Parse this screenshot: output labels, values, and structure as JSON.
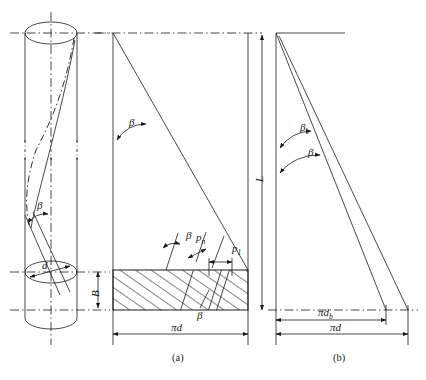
{
  "figure": {
    "background_color": "#ffffff",
    "line_color": "#1a1a1a",
    "captions": [
      {
        "key": "a",
        "text": "(a)"
      },
      {
        "key": "b",
        "text": "(b)"
      }
    ]
  },
  "cylinder_view": {
    "name": "cylinder-with-helix",
    "labels": {
      "beta": "β",
      "diameter": "d"
    }
  },
  "diagram_a": {
    "name": "unrolled-development-a",
    "labels": {
      "beta_top": "β",
      "beta_strip": "β",
      "beta_bottom": "β",
      "pitch_normal": "p",
      "pitch_normal_sub": "n",
      "pitch_axial": "p",
      "pitch_axial_sub": "1",
      "length": "L",
      "width": "B",
      "circumference": "πd"
    }
  },
  "diagram_b": {
    "name": "unrolled-development-b",
    "labels": {
      "beta_b": "β",
      "beta_b_sub": "b",
      "beta": "β",
      "circumference_b": "πd",
      "circumference_b_sub": "b",
      "circumference": "πd"
    }
  }
}
